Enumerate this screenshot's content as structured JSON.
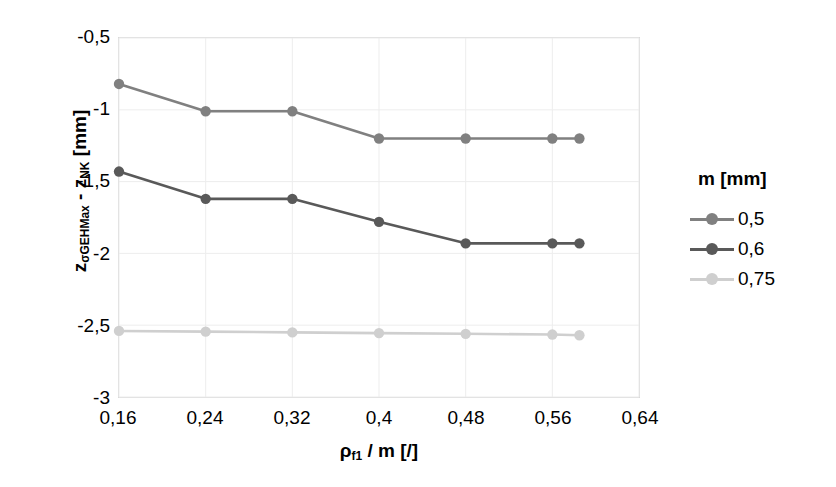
{
  "chart_data": {
    "type": "line",
    "title": "",
    "xlabel": "ρf1 / m [/]",
    "xlabel_base": "ρ",
    "xlabel_sub": "f1",
    "xlabel_rest": " / m [/]",
    "ylabel": "zσGEHMax - zNK [mm]",
    "ylabel_part1": "z",
    "ylabel_sub1": "σGEHMax",
    "ylabel_part2": " - z",
    "ylabel_sub2": "NK",
    "ylabel_part3": " [mm]",
    "xlim": [
      0.16,
      0.64
    ],
    "ylim": [
      -3,
      -0.5
    ],
    "grid": true,
    "legend_position": "right",
    "legend_title": "m [mm]",
    "xticks": [
      "0,16",
      "0,24",
      "0,32",
      "0,4",
      "0,48",
      "0,56",
      "0,64"
    ],
    "xtick_values": [
      0.16,
      0.24,
      0.32,
      0.4,
      0.48,
      0.56,
      0.64
    ],
    "yticks": [
      "-0,5",
      "-1",
      "-1,5",
      "-2",
      "-2,5",
      "-3"
    ],
    "ytick_values": [
      -0.5,
      -1,
      -1.5,
      -2,
      -2.5,
      -3
    ],
    "x": [
      0.16,
      0.24,
      0.32,
      0.4,
      0.48,
      0.56,
      0.585
    ],
    "series": [
      {
        "name": "0,5",
        "color": "#808080",
        "values": [
          -0.82,
          -1.01,
          -1.01,
          -1.2,
          -1.2,
          -1.2,
          -1.2
        ]
      },
      {
        "name": "0,6",
        "color": "#595959",
        "values": [
          -1.43,
          -1.62,
          -1.62,
          -1.78,
          -1.93,
          -1.93,
          -1.93
        ]
      },
      {
        "name": "0,75",
        "color": "#cfcfcf",
        "values": [
          -2.54,
          -2.545,
          -2.55,
          -2.555,
          -2.56,
          -2.565,
          -2.57
        ]
      }
    ]
  },
  "axes": {
    "frame_color": "#d9d9d9",
    "grid_color": "#ededed"
  },
  "legend": {
    "title": "m [mm]",
    "entries": [
      {
        "label": "0,5",
        "color": "#808080"
      },
      {
        "label": "0,6",
        "color": "#595959"
      },
      {
        "label": "0,75",
        "color": "#cfcfcf"
      }
    ]
  }
}
